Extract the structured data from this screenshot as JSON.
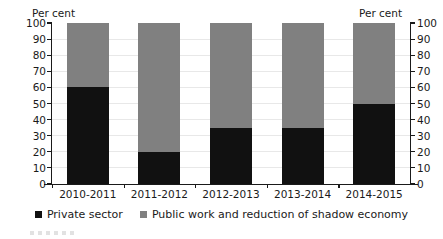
{
  "chart_data": {
    "type": "bar",
    "subtype": "stacked-bar-100",
    "title": "",
    "xlabel": "",
    "ylabel": "Per cent",
    "ylabel_right": "Per cent",
    "ylim": [
      0,
      100
    ],
    "yticks": [
      0,
      10,
      20,
      30,
      40,
      50,
      60,
      70,
      80,
      90,
      100
    ],
    "grid": true,
    "legend_position": "bottom",
    "categories": [
      "2010-2011",
      "2011-2012",
      "2012-2013",
      "2013-2014",
      "2014-2015"
    ],
    "series": [
      {
        "name": "Private sector",
        "color": "#111111",
        "values": [
          60,
          20,
          35,
          35,
          50
        ]
      },
      {
        "name": "Public work and reduction of shadow economy",
        "color": "#808080",
        "values": [
          40,
          80,
          65,
          65,
          50
        ]
      }
    ]
  },
  "axis": {
    "left_title": "Per cent",
    "right_title": "Per cent"
  },
  "legend": {
    "items": [
      {
        "label": "Private sector",
        "color": "#111111",
        "swatch": "square-marker-icon"
      },
      {
        "label": "Public work and reduction of shadow economy",
        "color": "#808080",
        "swatch": "square-marker-icon"
      }
    ]
  }
}
